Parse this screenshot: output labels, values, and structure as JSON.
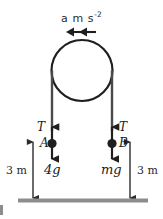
{
  "figure": {
    "colors": {
      "stroke": "#2b2b2b",
      "pulley": "#1f1f1f",
      "rope": "#4a4a4a",
      "ground": "#8d8d8d",
      "text": "#1a1a1a"
    }
  },
  "labels": {
    "acceleration_value": "a m s",
    "acceleration_exponent": "-2",
    "tension_left": "T",
    "tension_right": "T",
    "body_left": "A",
    "body_right": "B",
    "weight_left": "4g",
    "weight_right": "mg",
    "height_left": "3 m",
    "height_right": "3 m"
  },
  "geometry": {
    "pulley": {
      "cx": 82,
      "cy": 70.5,
      "r": 30.5
    },
    "rope_left_x": 52,
    "rope_right_x": 112,
    "rope_top_y": 70.5,
    "rope_bottom_y": 133,
    "mass_left": {
      "x": 52,
      "y": 143
    },
    "mass_right": {
      "x": 112,
      "y": 143
    },
    "ground": {
      "x1": 18,
      "x2": 148,
      "y": 200
    },
    "dim_left_x": 33,
    "dim_right_x": 130,
    "dim_top_y": 140,
    "dim_bottom_y": 200,
    "accel_arrow": {
      "x1": 67,
      "x2": 97,
      "y": 32
    }
  }
}
